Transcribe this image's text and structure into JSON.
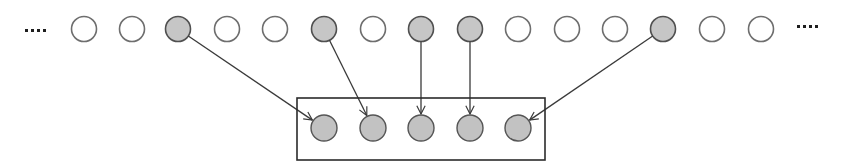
{
  "diagram": {
    "title": "Sampling a subset of items from a sequence",
    "colors": {
      "empty_fill": "#ffffff",
      "empty_stroke": "#6e6e6e",
      "filled_fill": "#c6c6c6",
      "filled_stroke": "#505050",
      "edge": "#3a3a3a",
      "frame": "#2b2b2b"
    },
    "ellipsis_left": "....",
    "ellipsis_right": "....",
    "top_row": {
      "y": 29,
      "r": 12.5,
      "nodes": [
        {
          "x": 84,
          "filled": false
        },
        {
          "x": 132,
          "filled": false
        },
        {
          "x": 178,
          "filled": true
        },
        {
          "x": 227,
          "filled": false
        },
        {
          "x": 275,
          "filled": false
        },
        {
          "x": 324,
          "filled": true
        },
        {
          "x": 373,
          "filled": false
        },
        {
          "x": 421,
          "filled": true
        },
        {
          "x": 470,
          "filled": true
        },
        {
          "x": 518,
          "filled": false
        },
        {
          "x": 567,
          "filled": false
        },
        {
          "x": 615,
          "filled": false
        },
        {
          "x": 663,
          "filled": true
        },
        {
          "x": 712,
          "filled": false
        },
        {
          "x": 761,
          "filled": false
        }
      ]
    },
    "bottom_row": {
      "y": 128,
      "r": 13,
      "frame": {
        "x": 297,
        "y": 98,
        "width": 248,
        "height": 62
      },
      "nodes": [
        {
          "x": 324
        },
        {
          "x": 373
        },
        {
          "x": 421
        },
        {
          "x": 470
        },
        {
          "x": 518
        }
      ]
    },
    "edges": [
      {
        "from_top": 2,
        "to_bottom": 0
      },
      {
        "from_top": 5,
        "to_bottom": 1
      },
      {
        "from_top": 7,
        "to_bottom": 2
      },
      {
        "from_top": 8,
        "to_bottom": 3
      },
      {
        "from_top": 12,
        "to_bottom": 4
      }
    ]
  }
}
